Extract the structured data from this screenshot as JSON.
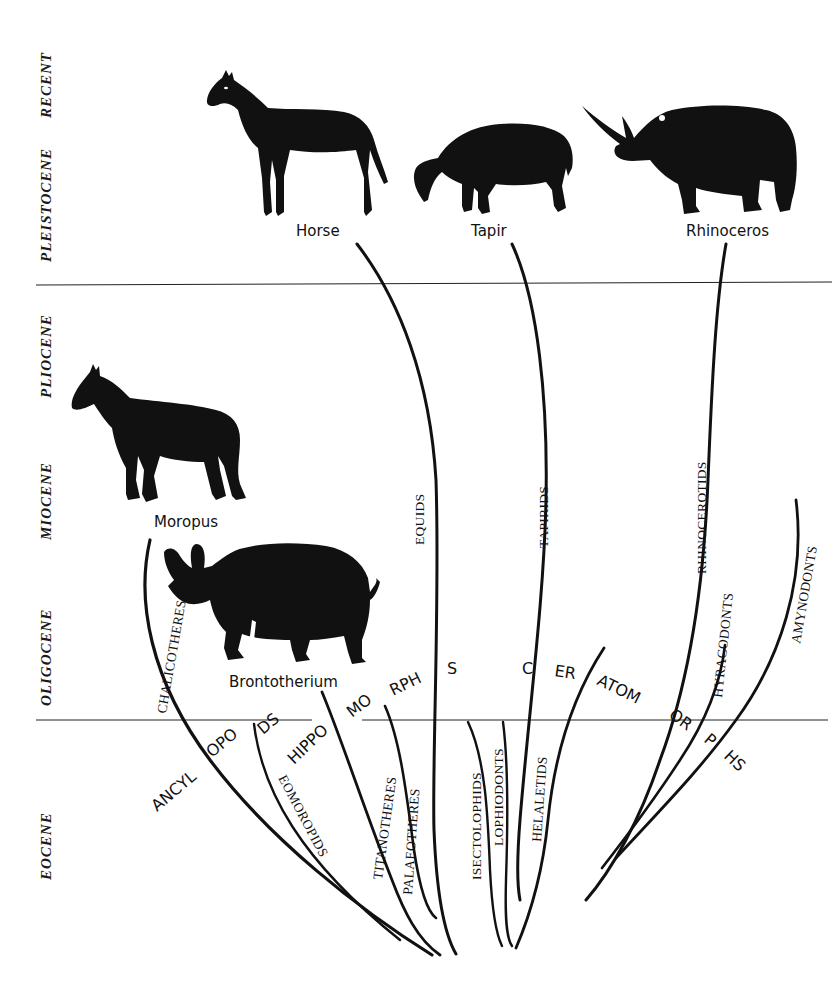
{
  "diagram": {
    "type": "phylogenetic-tree",
    "epochs": [
      {
        "label": "RECENT"
      },
      {
        "label": "PLEISTOCENE"
      },
      {
        "label": "PLIOCENE"
      },
      {
        "label": "MIOCENE"
      },
      {
        "label": "OLIGOCENE"
      },
      {
        "label": "EOCENE"
      }
    ],
    "animals": [
      {
        "label": "Horse"
      },
      {
        "label": "Tapir"
      },
      {
        "label": "Rhinoceros"
      },
      {
        "label": "Moropus"
      },
      {
        "label": "Brontotherium"
      }
    ],
    "lineages": [
      {
        "label": "CHALICOTHERES"
      },
      {
        "label": "EOMOROPIDS"
      },
      {
        "label": "TITANOTHERES"
      },
      {
        "label": "PALAEOTHERES"
      },
      {
        "label": "EQUIDS"
      },
      {
        "label": "ISECTOLOPHIDS"
      },
      {
        "label": "LOPHIODONTS"
      },
      {
        "label": "TAPIRIDS"
      },
      {
        "label": "HELALETIDS"
      },
      {
        "label": "RHINOCEROTIDS"
      },
      {
        "label": "HYRACODONTS"
      },
      {
        "label": "AMYNODONTS"
      }
    ],
    "group_labels": {
      "ancylopods": [
        "ANCYL",
        "OPO",
        "DS"
      ],
      "hippomorphs": [
        "HIPPO",
        "MO",
        "RPH",
        "S"
      ],
      "ceratomorphs": [
        "C",
        "ER",
        "ATOM",
        "OR",
        "P",
        "HS"
      ]
    }
  }
}
